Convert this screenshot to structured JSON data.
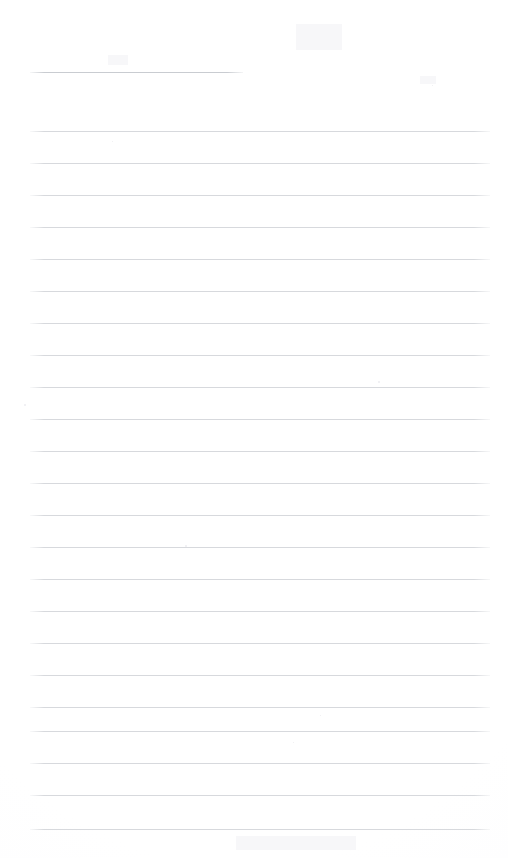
{
  "document": {
    "kind": "scanned-ruled-notepad-page",
    "title": "Blank Lined Page",
    "page_width": 508,
    "page_height": 858,
    "background_color": "#ffffff",
    "has_text_content": false,
    "text_content": ""
  },
  "ruling": {
    "line_color": "#d7d9dd",
    "header_rule_color": "#c9ccd1",
    "line_thickness": 1,
    "line_spacing": 32,
    "left_margin": 30,
    "right_margin": 490,
    "header_rule": {
      "label": "header-rule",
      "y": 72,
      "x_start": 30,
      "x_end": 243
    },
    "body_rules": [
      {
        "y": 131,
        "x_start": 30,
        "x_end": 490
      },
      {
        "y": 163,
        "x_start": 30,
        "x_end": 490
      },
      {
        "y": 195,
        "x_start": 30,
        "x_end": 490
      },
      {
        "y": 227,
        "x_start": 30,
        "x_end": 490
      },
      {
        "y": 259,
        "x_start": 30,
        "x_end": 490
      },
      {
        "y": 291,
        "x_start": 30,
        "x_end": 490
      },
      {
        "y": 323,
        "x_start": 30,
        "x_end": 490
      },
      {
        "y": 355,
        "x_start": 30,
        "x_end": 490
      },
      {
        "y": 387,
        "x_start": 30,
        "x_end": 490
      },
      {
        "y": 419,
        "x_start": 30,
        "x_end": 490
      },
      {
        "y": 451,
        "x_start": 30,
        "x_end": 490
      },
      {
        "y": 483,
        "x_start": 30,
        "x_end": 490
      },
      {
        "y": 515,
        "x_start": 30,
        "x_end": 490
      },
      {
        "y": 547,
        "x_start": 30,
        "x_end": 490
      },
      {
        "y": 579,
        "x_start": 30,
        "x_end": 490
      },
      {
        "y": 611,
        "x_start": 30,
        "x_end": 490
      },
      {
        "y": 643,
        "x_start": 30,
        "x_end": 490
      },
      {
        "y": 675,
        "x_start": 30,
        "x_end": 490
      },
      {
        "y": 707,
        "x_start": 30,
        "x_end": 490
      },
      {
        "y": 731,
        "x_start": 30,
        "x_end": 490
      },
      {
        "y": 763,
        "x_start": 30,
        "x_end": 490
      },
      {
        "y": 795,
        "x_start": 30,
        "x_end": 490
      },
      {
        "y": 829,
        "x_start": 30,
        "x_end": 490
      }
    ]
  },
  "artifacts": {
    "specks": [
      {
        "x": 185,
        "y": 545,
        "size": 2
      },
      {
        "x": 378,
        "y": 381,
        "size": 2
      },
      {
        "x": 24,
        "y": 404,
        "size": 2
      },
      {
        "x": 112,
        "y": 141,
        "size": 1
      },
      {
        "x": 432,
        "y": 85,
        "size": 1
      },
      {
        "x": 320,
        "y": 715,
        "size": 1
      },
      {
        "x": 293,
        "y": 742,
        "size": 1
      }
    ],
    "smudges": [
      {
        "x": 296,
        "y": 24,
        "width": 46,
        "height": 26
      },
      {
        "x": 108,
        "y": 55,
        "width": 20,
        "height": 10
      },
      {
        "x": 420,
        "y": 76,
        "width": 16,
        "height": 8
      },
      {
        "x": 236,
        "y": 836,
        "width": 120,
        "height": 14
      }
    ]
  }
}
